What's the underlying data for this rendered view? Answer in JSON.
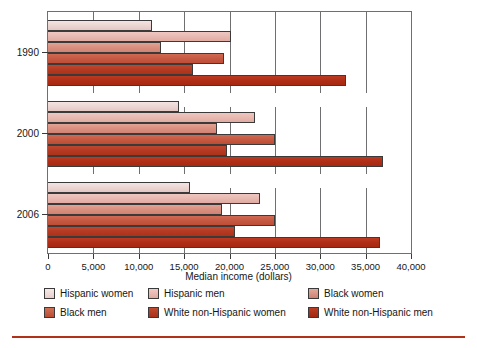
{
  "chart_data": {
    "type": "bar",
    "orientation": "horizontal",
    "title": "",
    "xlabel": "Median income (dollars)",
    "ylabel": "",
    "categories": [
      "1990",
      "2000",
      "2006"
    ],
    "xlim": [
      0,
      40000
    ],
    "xticks": [
      0,
      5000,
      10000,
      15000,
      20000,
      25000,
      30000,
      35000,
      40000
    ],
    "xtick_labels": [
      "0",
      "5,000",
      "10,000",
      "15,000",
      "20,000",
      "25,000",
      "30,000",
      "35,000",
      "40,000"
    ],
    "grid": true,
    "grid_axis": "x",
    "legend_position": "below",
    "series": [
      {
        "name": "Hispanic women",
        "color": "#ecd6d3",
        "values": [
          11500,
          14400,
          15700
        ]
      },
      {
        "name": "Hispanic men",
        "color": "#e8b9b1",
        "values": [
          20200,
          22800,
          23400
        ]
      },
      {
        "name": "Black women",
        "color": "#d9907f",
        "values": [
          12500,
          18600,
          19200
        ]
      },
      {
        "name": "Black men",
        "color": "#c65941",
        "values": [
          19400,
          25000,
          25000
        ]
      },
      {
        "name": "White non-Hispanic women",
        "color": "#b53a23",
        "values": [
          16000,
          19700,
          20600
        ]
      },
      {
        "name": "White non-Hispanic men",
        "color": "#b02d16",
        "values": [
          32800,
          36900,
          36600
        ]
      }
    ]
  },
  "axis": {
    "x_title": "Median income (dollars)",
    "x_tick_labels": [
      "0",
      "5,000",
      "10,000",
      "15,000",
      "20,000",
      "25,000",
      "30,000",
      "35,000",
      "40,000"
    ],
    "y_tick_labels": [
      "1990",
      "2000",
      "2006"
    ]
  },
  "legend": {
    "items": [
      {
        "label": "Hispanic women"
      },
      {
        "label": "Hispanic men"
      },
      {
        "label": "Black women"
      },
      {
        "label": "Black men"
      },
      {
        "label": "White non-Hispanic women"
      },
      {
        "label": "White non-Hispanic men"
      }
    ]
  },
  "colors": {
    "accent_rule": "#b1301a",
    "frame": "#6f6f72",
    "text": "#161616"
  }
}
